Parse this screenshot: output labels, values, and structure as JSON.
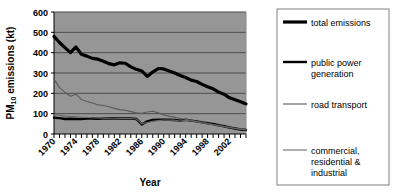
{
  "chart_data": {
    "type": "line",
    "title": "",
    "xlabel": "Year",
    "ylabel": "PM10 emissions (kt)",
    "ylabel_main": "PM",
    "ylabel_sub": "10",
    "ylabel_tail": " emissions (kt)",
    "xlim": [
      1970,
      2005
    ],
    "ylim": [
      0,
      600
    ],
    "yticks": [
      0,
      100,
      200,
      300,
      400,
      500,
      600
    ],
    "xticks": [
      1970,
      1974,
      1978,
      1982,
      1986,
      1990,
      1994,
      1998,
      2002
    ],
    "xtick_labels": [
      "1970",
      "1974",
      "1978",
      "1982",
      "1986",
      "1990",
      "1994",
      "1998",
      "2002"
    ],
    "ytick_labels": [
      "0",
      "100",
      "200",
      "300",
      "400",
      "500",
      "600"
    ],
    "grid": true,
    "grid_axis": "y",
    "plot_background": "#969696",
    "grid_color": "#4d4d4d",
    "legend_position": "right-outside",
    "x": [
      1970,
      1971,
      1972,
      1973,
      1974,
      1975,
      1976,
      1977,
      1978,
      1979,
      1980,
      1981,
      1982,
      1983,
      1984,
      1985,
      1986,
      1987,
      1988,
      1989,
      1990,
      1991,
      1992,
      1993,
      1994,
      1995,
      1996,
      1997,
      1998,
      1999,
      2000,
      2001,
      2002,
      2003,
      2004,
      2005
    ],
    "series": [
      {
        "name": "total emissions",
        "color": "#000000",
        "width": 3.2,
        "values": [
          480,
          450,
          425,
          400,
          428,
          392,
          383,
          372,
          368,
          358,
          346,
          340,
          350,
          348,
          330,
          318,
          310,
          283,
          305,
          322,
          320,
          310,
          300,
          288,
          278,
          265,
          258,
          244,
          232,
          222,
          206,
          196,
          178,
          168,
          158,
          148
        ]
      },
      {
        "name": "public power generation",
        "color": "#000000",
        "width": 2.4,
        "values": [
          80,
          78,
          74,
          75,
          74,
          73,
          76,
          76,
          75,
          76,
          77,
          76,
          76,
          77,
          76,
          74,
          47,
          62,
          69,
          70,
          70,
          70,
          69,
          66,
          70,
          66,
          62,
          57,
          53,
          49,
          43,
          38,
          32,
          27,
          22,
          20
        ]
      },
      {
        "name": "road transport",
        "color": "#5a5a5a",
        "width": 1.1,
        "values": [
          270,
          228,
          205,
          186,
          196,
          170,
          160,
          152,
          144,
          140,
          134,
          126,
          120,
          117,
          110,
          104,
          102,
          108,
          112,
          104,
          94,
          88,
          82,
          76,
          72,
          68,
          62,
          56,
          52,
          47,
          41,
          37,
          33,
          28,
          24,
          22
        ]
      },
      {
        "name": "commercial, residential & industrial",
        "color": "#6a6a6a",
        "width": 1.1,
        "values": [
          96,
          92,
          88,
          86,
          86,
          82,
          82,
          80,
          79,
          78,
          76,
          75,
          76,
          76,
          76,
          74,
          50,
          56,
          62,
          66,
          68,
          68,
          68,
          64,
          68,
          64,
          60,
          55,
          51,
          47,
          42,
          37,
          31,
          27,
          23,
          20
        ]
      }
    ]
  },
  "legend": {
    "items": [
      {
        "label": "total emissions",
        "color": "#000000",
        "width": 3.2
      },
      {
        "label": "public power generation",
        "label_line1": "public power",
        "label_line2": "generation",
        "color": "#000000",
        "width": 2.4
      },
      {
        "label": "road transport",
        "color": "#5a5a5a",
        "width": 1.1
      },
      {
        "label": "commercial, residential & industrial",
        "label_line1": "commercial,",
        "label_line2": "residential &",
        "label_line3": "industrial",
        "color": "#6a6a6a",
        "width": 1.1
      }
    ]
  }
}
